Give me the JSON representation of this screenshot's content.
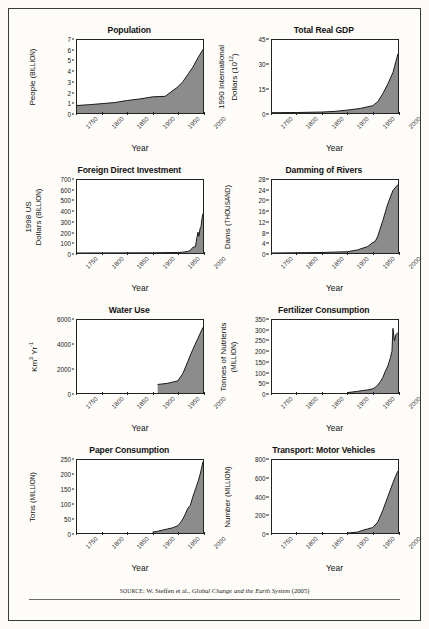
{
  "figure": {
    "source_prefix": "SOURCE:",
    "source_text": " W. Steffen et al., ",
    "source_italic": "Global Change and the Earth System",
    "source_year": " (2005)",
    "xlabel": "Year",
    "fill_color": "#8c8c8c",
    "line_color": "#1a1a1a",
    "frame_color": "#3a3a3a",
    "background": "#fdfcf9"
  },
  "chart_data": [
    {
      "type": "area",
      "title": "Population",
      "xlabel": "Year",
      "ylabel": "People",
      "ylabel_unit": "BILLION",
      "ylabel_full": "People (BILLION)",
      "xlim": [
        1750,
        2000
      ],
      "ylim": [
        0,
        7
      ],
      "xticks": [
        "1750",
        "1800",
        "1850",
        "1900",
        "1950",
        "2000"
      ],
      "yticks": [
        "0",
        "1",
        "2",
        "3",
        "4",
        "5",
        "6",
        "7"
      ],
      "grid": false,
      "x": [
        1750,
        1775,
        1800,
        1825,
        1850,
        1875,
        1900,
        1925,
        1950,
        1960,
        1970,
        1980,
        1990,
        2000
      ],
      "values": [
        0.72,
        0.8,
        0.9,
        1.0,
        1.2,
        1.35,
        1.55,
        1.6,
        2.5,
        3.0,
        3.7,
        4.4,
        5.3,
        6.1
      ]
    },
    {
      "type": "area",
      "title": "Total Real GDP",
      "xlabel": "Year",
      "ylabel": "1990 International Dollars",
      "ylabel_unit": "10^12",
      "ylabel_full": "1990 International Dollars (10¹²)",
      "xlim": [
        1750,
        2000
      ],
      "ylim": [
        0,
        45
      ],
      "xticks": [
        "1750",
        "1800",
        "1850",
        "1900",
        "1950",
        "2000"
      ],
      "yticks": [
        "0",
        "15",
        "30",
        "45"
      ],
      "grid": false,
      "x": [
        1750,
        1800,
        1850,
        1875,
        1900,
        1925,
        1950,
        1960,
        1970,
        1980,
        1990,
        2000
      ],
      "values": [
        0.2,
        0.3,
        0.6,
        1.0,
        1.8,
        2.8,
        4.5,
        7.0,
        12.0,
        18.0,
        25.0,
        36.5
      ]
    },
    {
      "type": "area",
      "title": "Foreign Direct Investment",
      "xlabel": "Year",
      "ylabel": "1998 US Dollars",
      "ylabel_unit": "BILLION",
      "ylabel_full": "1998 US Dollars (BILLION)",
      "xlim": [
        1750,
        2000
      ],
      "ylim": [
        0,
        700
      ],
      "xticks": [
        "1750",
        "1800",
        "1850",
        "1900",
        "1950",
        "2000"
      ],
      "yticks": [
        "0",
        "100",
        "200",
        "300",
        "400",
        "500",
        "600",
        "700"
      ],
      "grid": false,
      "x": [
        1750,
        1900,
        1950,
        1960,
        1970,
        1975,
        1980,
        1985,
        1988,
        1990,
        1992,
        1994,
        1996,
        1998,
        2000
      ],
      "values": [
        0,
        2,
        5,
        8,
        15,
        25,
        55,
        60,
        150,
        200,
        160,
        230,
        250,
        330,
        380
      ]
    },
    {
      "type": "area",
      "title": "Damming of Rivers",
      "xlabel": "Year",
      "ylabel": "Dams",
      "ylabel_unit": "THOUSAND",
      "ylabel_full": "Dams (THOUSAND)",
      "xlim": [
        1750,
        2000
      ],
      "ylim": [
        0,
        28
      ],
      "xticks": [
        "1750",
        "1800",
        "1850",
        "1900",
        "1950",
        "2000"
      ],
      "yticks": [
        "0",
        "4",
        "8",
        "12",
        "16",
        "20",
        "24",
        "28"
      ],
      "grid": false,
      "x": [
        1750,
        1850,
        1900,
        1920,
        1940,
        1950,
        1955,
        1960,
        1970,
        1980,
        1990,
        2000
      ],
      "values": [
        0,
        0.2,
        0.5,
        1.2,
        2.5,
        4.0,
        4.5,
        6.5,
        12.5,
        19.0,
        24.0,
        26.3
      ]
    },
    {
      "type": "area",
      "title": "Water Use",
      "xlabel": "Year",
      "ylabel": "Km³ Yr⁻¹",
      "ylabel_unit": "",
      "ylabel_full": "Km³ Yr⁻¹",
      "xlim": [
        1750,
        2000
      ],
      "ylim": [
        0,
        6000
      ],
      "xticks": [
        "1750",
        "1800",
        "1850",
        "1900",
        "1950",
        "2000"
      ],
      "yticks": [
        "0",
        "2000",
        "4000",
        "6000"
      ],
      "grid": false,
      "x": [
        1910,
        1920,
        1930,
        1940,
        1950,
        1960,
        1970,
        1980,
        1990,
        2000
      ],
      "values": [
        700,
        750,
        800,
        900,
        1000,
        1600,
        2600,
        3600,
        4500,
        5400
      ]
    },
    {
      "type": "area",
      "title": "Fertilizer Consumption",
      "xlabel": "Year",
      "ylabel": "Tonnes of Nutrients",
      "ylabel_unit": "MILLION",
      "ylabel_full": "Tonnes of Nutrients (MILLION)",
      "xlim": [
        1750,
        2000
      ],
      "ylim": [
        0,
        350
      ],
      "xticks": [
        "1750",
        "1800",
        "1850",
        "1900",
        "1950",
        "2000"
      ],
      "yticks": [
        "0",
        "50",
        "100",
        "150",
        "200",
        "250",
        "300",
        "350"
      ],
      "grid": false,
      "x": [
        1900,
        1920,
        1930,
        1940,
        1950,
        1955,
        1960,
        1965,
        1970,
        1975,
        1980,
        1985,
        1988,
        1990,
        1993,
        1996,
        2000
      ],
      "values": [
        2,
        8,
        12,
        15,
        20,
        28,
        38,
        55,
        75,
        105,
        130,
        170,
        200,
        310,
        250,
        280,
        290
      ]
    },
    {
      "type": "area",
      "title": "Paper Consumption",
      "xlabel": "Year",
      "ylabel": "Tons",
      "ylabel_unit": "MILLION",
      "ylabel_full": "Tons (MILLION)",
      "xlim": [
        1750,
        2000
      ],
      "ylim": [
        0,
        250
      ],
      "xticks": [
        "1750",
        "1800",
        "1850",
        "1900",
        "1950",
        "2000"
      ],
      "yticks": [
        "0",
        "50",
        "100",
        "150",
        "200",
        "250"
      ],
      "grid": false,
      "x": [
        1900,
        1910,
        1920,
        1930,
        1940,
        1950,
        1955,
        1960,
        1965,
        1970,
        1975,
        1980,
        1985,
        1990,
        1995,
        2000
      ],
      "values": [
        3,
        6,
        10,
        14,
        18,
        25,
        35,
        48,
        65,
        85,
        95,
        125,
        150,
        175,
        205,
        245
      ]
    },
    {
      "type": "area",
      "title": "Transport: Motor Vehicles",
      "xlabel": "Year",
      "ylabel": "Number",
      "ylabel_unit": "MILLION",
      "ylabel_full": "Number (MILLION)",
      "xlim": [
        1750,
        2000
      ],
      "ylim": [
        0,
        800
      ],
      "xticks": [
        "1750",
        "1800",
        "1850",
        "1900",
        "1950",
        "2000"
      ],
      "yticks": [
        "0",
        "200",
        "400",
        "600",
        "800"
      ],
      "grid": false,
      "x": [
        1900,
        1920,
        1930,
        1940,
        1950,
        1960,
        1970,
        1980,
        1990,
        1995,
        2000
      ],
      "values": [
        0,
        10,
        30,
        45,
        60,
        120,
        250,
        400,
        550,
        620,
        680
      ]
    }
  ]
}
